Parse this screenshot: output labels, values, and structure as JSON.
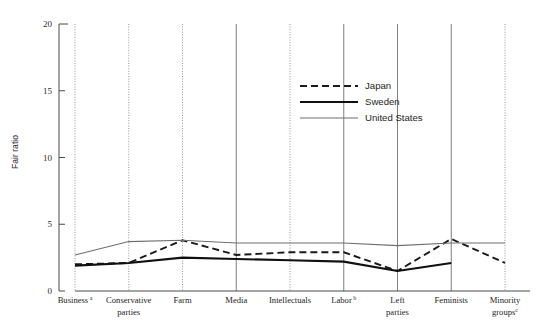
{
  "chart_data": {
    "type": "line",
    "title": "",
    "xlabel": "",
    "ylabel": "Fair ratio",
    "ylim": [
      0,
      20
    ],
    "yticks": [
      0,
      5,
      10,
      15,
      20
    ],
    "grid": "vertical-category-gridlines",
    "legend_position": "upper-center-right",
    "categories": [
      "Business",
      "Conservative parties",
      "Farm",
      "Media",
      "Intellectuals",
      "Labor",
      "Left parties",
      "Feminists",
      "Minority groups"
    ],
    "category_labels": [
      {
        "line1": "Business",
        "line2": "",
        "sup": "a"
      },
      {
        "line1": "Conservative",
        "line2": "parties",
        "sup": ""
      },
      {
        "line1": "Farm",
        "line2": "",
        "sup": ""
      },
      {
        "line1": "Media",
        "line2": "",
        "sup": ""
      },
      {
        "line1": "Intellectuals",
        "line2": "",
        "sup": ""
      },
      {
        "line1": "Labor",
        "line2": "",
        "sup": "b"
      },
      {
        "line1": "Left",
        "line2": "parties",
        "sup": ""
      },
      {
        "line1": "Feminists",
        "line2": "",
        "sup": ""
      },
      {
        "line1": "Minority",
        "line2": "groups",
        "sup": "c"
      }
    ],
    "series": [
      {
        "name": "Japan",
        "style": "dashed",
        "color": "#1a1a1a",
        "values": [
          2.0,
          2.1,
          3.8,
          2.7,
          2.9,
          2.9,
          1.5,
          3.9,
          2.1
        ]
      },
      {
        "name": "Sweden",
        "style": "solid-thick",
        "color": "#101010",
        "values": [
          1.9,
          2.1,
          2.5,
          2.4,
          2.3,
          2.2,
          1.5,
          2.1,
          null
        ]
      },
      {
        "name": "United States",
        "style": "solid-thin",
        "color": "#6e6e6e",
        "values": [
          2.7,
          3.7,
          3.8,
          3.6,
          3.6,
          3.6,
          3.4,
          3.6,
          3.6
        ]
      }
    ]
  },
  "legend": {
    "entries": [
      {
        "label": "Japan"
      },
      {
        "label": "Sweden"
      },
      {
        "label": "United States"
      }
    ]
  },
  "axis": {
    "y_title": "Fair ratio",
    "y_tick_labels": [
      "0",
      "5",
      "10",
      "15",
      "20"
    ]
  }
}
